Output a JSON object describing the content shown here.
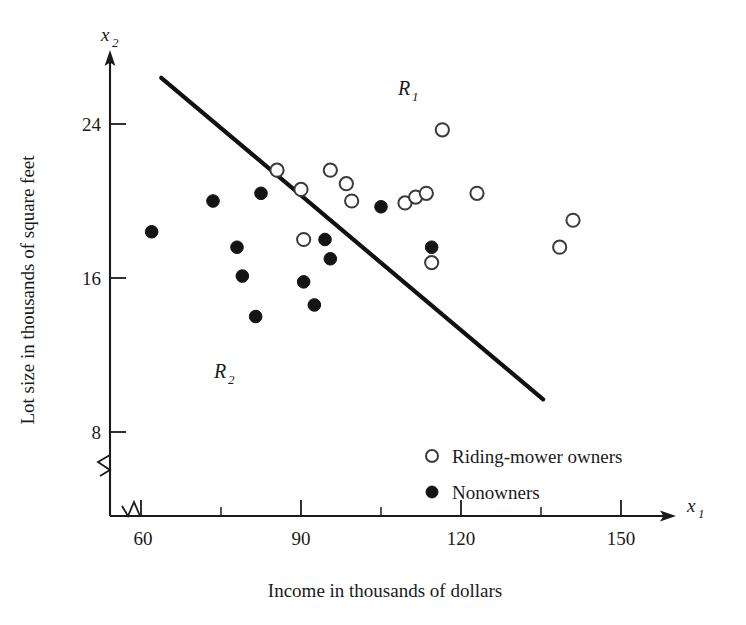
{
  "chart_data": {
    "type": "scatter",
    "title": "",
    "xlabel": "Income in thousands of dollars",
    "ylabel": "Lot size in thousands of square feet",
    "x_axis_var": "x",
    "x_axis_var_sub": "1",
    "y_axis_var": "x",
    "y_axis_var_sub": "2",
    "xlim": [
      54,
      162
    ],
    "ylim": [
      5.5,
      27.5
    ],
    "xticks": [
      60,
      90,
      120,
      150
    ],
    "xticks_minor": [
      75,
      105,
      135
    ],
    "yticks": [
      8,
      16,
      24
    ],
    "grid": false,
    "axis_break_x": true,
    "axis_break_y": true,
    "legend_position": "inside-bottom-right",
    "series": [
      {
        "name": "Riding-mower owners",
        "marker": "open-circle",
        "color": "#ffffff",
        "edge_color": "#3a3a40",
        "points": [
          {
            "x": 85.5,
            "y": 21.6
          },
          {
            "x": 90.0,
            "y": 20.6
          },
          {
            "x": 90.5,
            "y": 18.0
          },
          {
            "x": 95.5,
            "y": 21.6
          },
          {
            "x": 98.5,
            "y": 20.9
          },
          {
            "x": 99.5,
            "y": 20.0
          },
          {
            "x": 109.5,
            "y": 19.9
          },
          {
            "x": 111.5,
            "y": 20.2
          },
          {
            "x": 113.5,
            "y": 20.4
          },
          {
            "x": 114.5,
            "y": 16.8
          },
          {
            "x": 116.5,
            "y": 23.7
          },
          {
            "x": 123.0,
            "y": 20.4
          },
          {
            "x": 138.5,
            "y": 17.6
          },
          {
            "x": 141.0,
            "y": 19.0
          }
        ]
      },
      {
        "name": "Nonowners",
        "marker": "filled-circle",
        "color": "#141414",
        "edge_color": "#141414",
        "points": [
          {
            "x": 62.0,
            "y": 18.4
          },
          {
            "x": 73.5,
            "y": 20.0
          },
          {
            "x": 78.0,
            "y": 17.6
          },
          {
            "x": 79.0,
            "y": 16.1
          },
          {
            "x": 81.5,
            "y": 14.0
          },
          {
            "x": 82.5,
            "y": 20.4
          },
          {
            "x": 90.5,
            "y": 15.8
          },
          {
            "x": 92.5,
            "y": 14.6
          },
          {
            "x": 94.5,
            "y": 18.0
          },
          {
            "x": 95.5,
            "y": 17.0
          },
          {
            "x": 105.0,
            "y": 19.7
          },
          {
            "x": 114.5,
            "y": 17.6
          }
        ]
      }
    ],
    "annotations": [
      {
        "text": "R",
        "sub": "1",
        "x": 114.0,
        "y": 25.5,
        "name": "region-label-r1"
      },
      {
        "text": "R",
        "sub": "2",
        "x": 75.5,
        "y": 11.2,
        "name": "region-label-r2"
      }
    ],
    "separator_line": {
      "name": "discriminant-line",
      "x1": 63.8,
      "y1": 26.4,
      "x2": 135.4,
      "y2": 9.7
    }
  },
  "legend": {
    "items": [
      {
        "label": "Riding-mower owners",
        "marker": "open-circle"
      },
      {
        "label": "Nonowners",
        "marker": "filled-circle"
      }
    ]
  }
}
